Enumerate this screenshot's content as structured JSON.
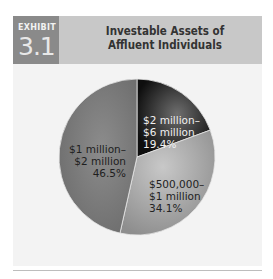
{
  "exhibit": {
    "label": "EXHIBIT",
    "number": "3.1"
  },
  "chart_data": {
    "type": "pie",
    "title": "Investable Assets of Affluent Individuals",
    "categories": [
      "$2 million–$6 million",
      "$500,000–$1 million",
      "$1 million–$2 million"
    ],
    "values": [
      19.4,
      34.1,
      46.5
    ],
    "unit": "%",
    "colors": [
      "#1a1a1a",
      "#a8a8a8",
      "#7d7d7d"
    ]
  },
  "labels": {
    "slice1": {
      "line1": "$2 million–",
      "line2": "$6 million",
      "line3": "19.4%"
    },
    "slice2": {
      "line1": "$500,000–",
      "line2": "$1 million",
      "line3": "34.1%"
    },
    "slice3": {
      "line1": "$1 million–",
      "line2": "$2 million",
      "line3": "46.5%"
    }
  },
  "title_lines": {
    "line1": "Investable Assets of",
    "line2": "Affluent Individuals"
  }
}
